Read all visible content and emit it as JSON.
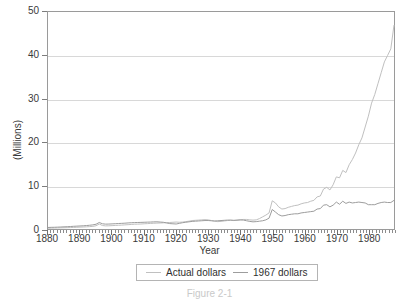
{
  "chart_data": {
    "type": "line",
    "title": "",
    "xlabel": "Year",
    "ylabel": "(Millions)",
    "xlim": [
      1880,
      1988
    ],
    "ylim": [
      0,
      50
    ],
    "yticks": [
      0,
      10,
      20,
      30,
      40,
      50
    ],
    "xticks": [
      1880,
      1890,
      1900,
      1910,
      1920,
      1930,
      1940,
      1950,
      1960,
      1970,
      1980
    ],
    "grid": true,
    "legend_position": "bottom-center",
    "x": [
      1880,
      1881,
      1882,
      1883,
      1884,
      1885,
      1886,
      1887,
      1888,
      1889,
      1890,
      1891,
      1892,
      1893,
      1894,
      1895,
      1896,
      1897,
      1898,
      1899,
      1900,
      1901,
      1902,
      1903,
      1904,
      1905,
      1906,
      1907,
      1908,
      1909,
      1910,
      1911,
      1912,
      1913,
      1914,
      1915,
      1916,
      1917,
      1918,
      1919,
      1920,
      1921,
      1922,
      1923,
      1924,
      1925,
      1926,
      1927,
      1928,
      1929,
      1930,
      1931,
      1932,
      1933,
      1934,
      1935,
      1936,
      1937,
      1938,
      1939,
      1940,
      1941,
      1942,
      1943,
      1944,
      1945,
      1946,
      1947,
      1948,
      1949,
      1950,
      1951,
      1952,
      1953,
      1954,
      1955,
      1956,
      1957,
      1958,
      1959,
      1960,
      1961,
      1962,
      1963,
      1964,
      1965,
      1966,
      1967,
      1968,
      1969,
      1970,
      1971,
      1972,
      1973,
      1974,
      1975,
      1976,
      1977,
      1978,
      1979,
      1980,
      1981,
      1982,
      1983,
      1984,
      1985,
      1986,
      1987,
      1988
    ],
    "series": [
      {
        "name": "Actual dollars",
        "color": "#c0c0c0",
        "values": [
          0.18,
          0.2,
          0.22,
          0.24,
          0.26,
          0.28,
          0.3,
          0.33,
          0.36,
          0.4,
          0.43,
          0.46,
          0.5,
          0.55,
          0.6,
          0.75,
          1.15,
          0.8,
          0.72,
          0.74,
          0.78,
          0.82,
          0.86,
          0.9,
          0.95,
          1.0,
          1.05,
          1.1,
          1.12,
          1.15,
          1.2,
          1.24,
          1.28,
          1.32,
          1.36,
          1.38,
          1.42,
          1.46,
          1.5,
          1.55,
          1.6,
          1.55,
          1.6,
          1.7,
          1.8,
          1.95,
          2.0,
          2.05,
          2.1,
          2.15,
          2.1,
          1.95,
          1.8,
          1.7,
          1.75,
          1.85,
          1.95,
          2.0,
          1.95,
          2.0,
          2.1,
          2.2,
          2.2,
          2.1,
          2.05,
          2.1,
          2.4,
          2.8,
          3.2,
          3.7,
          6.5,
          6.0,
          5.1,
          4.6,
          4.7,
          5.0,
          5.2,
          5.4,
          5.5,
          5.8,
          6.0,
          6.1,
          6.4,
          6.6,
          7.4,
          7.6,
          9.2,
          9.6,
          9.0,
          10.2,
          12.0,
          11.8,
          13.5,
          13.0,
          14.8,
          16.0,
          17.5,
          19.4,
          21.0,
          23.5,
          26.0,
          29.0,
          31.0,
          33.5,
          36.0,
          38.5,
          40.0,
          41.5,
          47.0
        ]
      },
      {
        "name": "1967 dollars",
        "color": "#9d9d9d",
        "values": [
          0.35,
          0.38,
          0.4,
          0.43,
          0.46,
          0.5,
          0.53,
          0.57,
          0.62,
          0.66,
          0.7,
          0.74,
          0.8,
          0.86,
          0.95,
          1.1,
          1.5,
          1.2,
          1.12,
          1.14,
          1.18,
          1.22,
          1.26,
          1.3,
          1.34,
          1.4,
          1.44,
          1.48,
          1.5,
          1.52,
          1.55,
          1.58,
          1.6,
          1.64,
          1.66,
          1.6,
          1.55,
          1.4,
          1.25,
          1.2,
          1.15,
          1.3,
          1.45,
          1.55,
          1.65,
          1.75,
          1.8,
          1.85,
          1.9,
          1.95,
          1.95,
          1.9,
          1.85,
          1.9,
          1.95,
          2.0,
          2.05,
          2.05,
          2.0,
          2.05,
          2.1,
          2.05,
          1.9,
          1.75,
          1.65,
          1.7,
          1.8,
          1.9,
          2.1,
          2.5,
          4.5,
          3.9,
          3.3,
          3.0,
          3.1,
          3.3,
          3.4,
          3.5,
          3.5,
          3.7,
          3.8,
          3.9,
          4.0,
          4.1,
          4.6,
          4.7,
          5.5,
          5.6,
          5.1,
          5.5,
          6.2,
          5.7,
          6.4,
          5.9,
          6.2,
          6.0,
          6.1,
          6.2,
          6.1,
          6.0,
          5.6,
          5.6,
          5.6,
          5.9,
          6.1,
          6.2,
          6.1,
          6.1,
          6.6
        ]
      }
    ]
  },
  "axes": {
    "y_title": "(Millions)",
    "x_title": "Year",
    "y_tick_labels": [
      "0",
      "10",
      "20",
      "30",
      "40",
      "50"
    ],
    "x_tick_labels": [
      "1880",
      "1890",
      "1900",
      "1910",
      "1920",
      "1930",
      "1940",
      "1950",
      "1960",
      "1970",
      "1980"
    ]
  },
  "legend": {
    "entries": [
      {
        "label": "Actual dollars",
        "color": "#c0c0c0"
      },
      {
        "label": "1967 dollars",
        "color": "#9d9d9d"
      }
    ]
  },
  "caption": {
    "text": "Figure 2-1"
  },
  "colors": {
    "frame": "#9a9a9a",
    "gridline": "#d8d8d8",
    "text": "#3a3a3a",
    "background": "#ffffff"
  }
}
